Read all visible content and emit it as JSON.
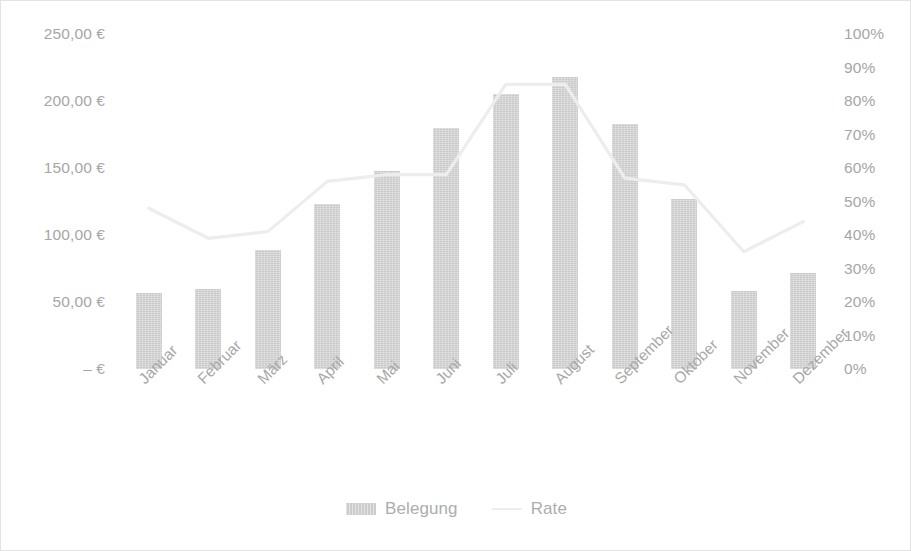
{
  "chart_data": {
    "type": "bar",
    "title": "",
    "subtitle": "",
    "xlabel": "",
    "ylabel": "",
    "categories": [
      "Januar",
      "Februar",
      "März",
      "April",
      "Mai",
      "Juni",
      "Juli",
      "August",
      "September",
      "Oktober",
      "November",
      "Dezember"
    ],
    "series": [
      {
        "name": "Belegung",
        "type": "bar",
        "axis": "left",
        "color": "#c9c9c9",
        "values": [
          57,
          60,
          89,
          123,
          148,
          180,
          205,
          218,
          183,
          127,
          58,
          72
        ]
      },
      {
        "name": "Rate",
        "type": "line",
        "axis": "right",
        "color": "#ededed",
        "values": [
          48,
          39,
          41,
          56,
          58,
          58,
          85,
          85,
          57,
          55,
          35,
          44
        ]
      }
    ],
    "left_axis": {
      "ticks": [
        0,
        50,
        100,
        150,
        200,
        250
      ],
      "tick_labels": [
        "– €",
        "50,00 €",
        "100,00 €",
        "150,00 €",
        "200,00 €",
        "250,00 €"
      ],
      "ylim": [
        0,
        250
      ],
      "unit": "€"
    },
    "right_axis": {
      "ticks": [
        0,
        10,
        20,
        30,
        40,
        50,
        60,
        70,
        80,
        90,
        100
      ],
      "tick_labels": [
        "0%",
        "10%",
        "20%",
        "30%",
        "40%",
        "50%",
        "60%",
        "70%",
        "80%",
        "90%",
        "100%"
      ],
      "ylim": [
        0,
        100
      ],
      "unit": "%"
    },
    "grid": false,
    "legend_position": "bottom"
  },
  "legend": {
    "items": [
      {
        "label": "Belegung",
        "swatch": "bar-swatch"
      },
      {
        "label": "Rate",
        "swatch": "line-swatch"
      }
    ]
  },
  "axis_left": {
    "labels": [
      "250,00 €",
      "200,00 €",
      "150,00 €",
      "100,00 €",
      "50,00 €",
      "– €"
    ]
  },
  "axis_right": {
    "labels": [
      "100%",
      "90%",
      "80%",
      "70%",
      "60%",
      "50%",
      "40%",
      "30%",
      "20%",
      "10%",
      "0%"
    ]
  },
  "colors": {
    "bar": "#c9c9c9",
    "line": "#ededed",
    "axis_text": "#a6a6a6",
    "border": "#e3e3e3",
    "background": "#ffffff"
  }
}
